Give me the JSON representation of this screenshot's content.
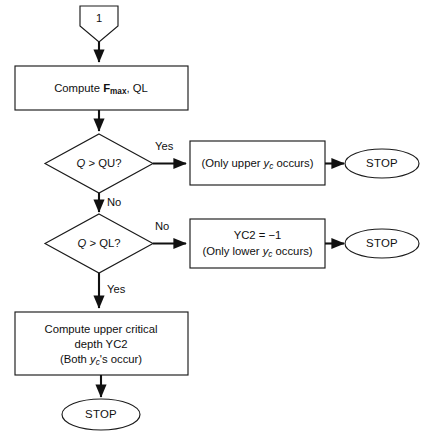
{
  "diagram": {
    "type": "flowchart",
    "background_color": "#ffffff",
    "line_color": "#111111",
    "shape_fill": "#ffffff"
  },
  "connector_in": {
    "label": "1",
    "shape": "pentagon-connector"
  },
  "process_compute_f": {
    "text_prefix": "Compute ",
    "text_f": "F",
    "text_sub": "max",
    "text_suffix": ", QL",
    "plain": "Compute Fmax, QL"
  },
  "decision_qu": {
    "var": "Q",
    "op": " > ",
    "rhs": "QU?",
    "plain": "Q > QU?",
    "branch_yes": "Yes",
    "branch_no": "No"
  },
  "decision_ql": {
    "var": "Q",
    "op": " > ",
    "rhs": "QL?",
    "plain": "Q > QL?",
    "branch_no": "No",
    "branch_yes": "Yes"
  },
  "box_only_upper": {
    "pre": "(Only upper ",
    "sym": "y",
    "sym_sub": "c",
    "post": " occurs)",
    "plain": "(Only upper yc occurs)"
  },
  "box_only_lower": {
    "line1": "YC2 = −1",
    "pre": "(Only lower ",
    "sym": "y",
    "sym_sub": "c",
    "post": " occurs)",
    "plain": "(Only lower yc occurs)"
  },
  "process_compute_yc2": {
    "line1": "Compute upper critical",
    "line2": "depth YC2",
    "pre": "(Both ",
    "sym": "y",
    "sym_sub": "c",
    "post": "'s occur)",
    "plain": "(Both yc's occur)"
  },
  "terminals": {
    "stop_upper": "STOP",
    "stop_lower": "STOP",
    "stop_final": "STOP"
  }
}
